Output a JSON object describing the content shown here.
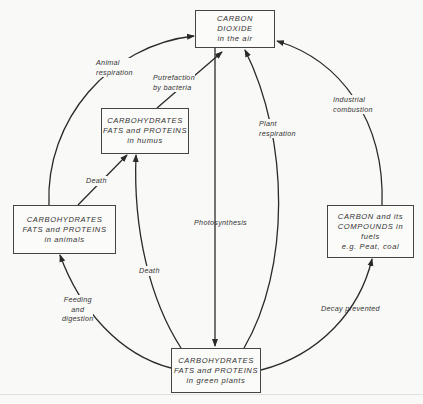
{
  "diagram": {
    "nodes": {
      "co2": {
        "lines": [
          "CARBON",
          "DIOXIDE",
          "in the air"
        ]
      },
      "humus": {
        "lines": [
          "CARBOHYDRATES",
          "FATS and PROTEINS",
          "in humus"
        ]
      },
      "animals": {
        "lines": [
          "CARBOHYDRATES",
          "FATS and PROTEINS",
          "in animals"
        ]
      },
      "fuels": {
        "lines": [
          "CARBON and its",
          "COMPOUNDS in",
          "fuels",
          "e.g. Peat, coal"
        ]
      },
      "plants": {
        "lines": [
          "CARBOHYDRATES",
          "FATS and PROTEINS",
          "in green plants"
        ]
      }
    },
    "edges": {
      "animal_respiration": {
        "lines": [
          "Animal",
          "respiration"
        ],
        "from": "animals",
        "to": "co2"
      },
      "putrefaction": {
        "lines": [
          "Putrefaction",
          "by bacteria"
        ],
        "from": "humus",
        "to": "co2"
      },
      "death_animals": {
        "lines": [
          "Death"
        ],
        "from": "animals",
        "to": "humus"
      },
      "death_plants": {
        "lines": [
          "Death"
        ],
        "from": "plants",
        "to": "humus"
      },
      "photosynthesis": {
        "lines": [
          "Photosynthesis"
        ],
        "from": "co2",
        "to": "plants"
      },
      "plant_respiration": {
        "lines": [
          "Plant",
          "respiration"
        ],
        "from": "plants",
        "to": "co2"
      },
      "industrial_combustion": {
        "lines": [
          "Industrial",
          "combustion"
        ],
        "from": "fuels",
        "to": "co2"
      },
      "feeding": {
        "lines": [
          "Feeding",
          "and",
          "digestion"
        ],
        "from": "plants",
        "to": "animals"
      },
      "decay_prevented": {
        "lines": [
          "Decay prevented"
        ],
        "from": "plants",
        "to": "fuels"
      }
    },
    "colors": {
      "line": "#2a2a2a",
      "text": "#333333",
      "background": "#f9f9f7"
    }
  }
}
